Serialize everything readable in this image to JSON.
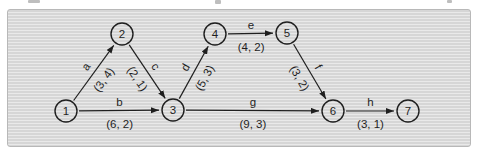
{
  "figure": {
    "ink_color": "#1f1f1f",
    "panel": {
      "stripe_dark": "#d6d6d6",
      "stripe_light": "#e9e9e9",
      "border_color": "#b8b8b8"
    }
  },
  "diagram": {
    "type": "activity-network",
    "nodes": [
      {
        "id": "1",
        "x": 66,
        "y": 111
      },
      {
        "id": "2",
        "x": 122,
        "y": 34
      },
      {
        "id": "3",
        "x": 173,
        "y": 110
      },
      {
        "id": "4",
        "x": 215,
        "y": 34
      },
      {
        "id": "5",
        "x": 287,
        "y": 33
      },
      {
        "id": "6",
        "x": 333,
        "y": 111
      },
      {
        "id": "7",
        "x": 408,
        "y": 111
      }
    ],
    "edges": [
      {
        "name": "a",
        "from": "1",
        "to": "2",
        "cost": "(3, 4)"
      },
      {
        "name": "b",
        "from": "1",
        "to": "3",
        "cost": "(6, 2)"
      },
      {
        "name": "c",
        "from": "2",
        "to": "3",
        "cost": "(2, 1)"
      },
      {
        "name": "d",
        "from": "3",
        "to": "4",
        "cost": "(5, 3)"
      },
      {
        "name": "e",
        "from": "4",
        "to": "5",
        "cost": "(4, 2)"
      },
      {
        "name": "f",
        "from": "5",
        "to": "6",
        "cost": "(3, 2)"
      },
      {
        "name": "g",
        "from": "3",
        "to": "6",
        "cost": "(9, 3)"
      },
      {
        "name": "h",
        "from": "6",
        "to": "7",
        "cost": "(3, 1)"
      }
    ]
  }
}
